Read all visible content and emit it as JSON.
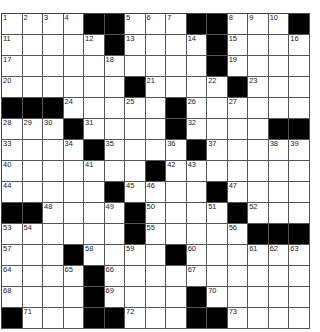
{
  "puzzle": {
    "rows": 15,
    "cols": 15,
    "colors": {
      "block": "#000000",
      "cell": "#ffffff",
      "line": "#555555",
      "number": "#222222"
    },
    "grid": [
      [
        1,
        2,
        3,
        4,
        "#",
        "#",
        5,
        6,
        7,
        "#",
        "#",
        8,
        9,
        10,
        "#"
      ],
      [
        11,
        0,
        0,
        0,
        12,
        "#",
        13,
        0,
        0,
        14,
        "#",
        15,
        0,
        0,
        16
      ],
      [
        17,
        0,
        0,
        0,
        0,
        18,
        0,
        0,
        0,
        0,
        "#",
        19,
        0,
        0,
        0
      ],
      [
        20,
        0,
        0,
        0,
        0,
        0,
        "#",
        21,
        0,
        0,
        22,
        "#",
        23,
        0,
        0
      ],
      [
        "#",
        "#",
        "#",
        24,
        0,
        0,
        25,
        0,
        "#",
        26,
        0,
        27,
        0,
        0,
        0
      ],
      [
        28,
        29,
        30,
        "#",
        31,
        0,
        0,
        0,
        "#",
        32,
        0,
        0,
        0,
        "#",
        "#"
      ],
      [
        33,
        0,
        0,
        34,
        "#",
        35,
        0,
        0,
        36,
        "#",
        37,
        0,
        0,
        38,
        39
      ],
      [
        40,
        0,
        0,
        0,
        41,
        0,
        0,
        "#",
        42,
        43,
        0,
        0,
        0,
        0,
        0
      ],
      [
        44,
        0,
        0,
        0,
        0,
        "#",
        45,
        46,
        0,
        0,
        "#",
        47,
        0,
        0,
        0
      ],
      [
        "#",
        "#",
        48,
        0,
        0,
        49,
        "#",
        50,
        0,
        0,
        51,
        "#",
        52,
        0,
        0
      ],
      [
        53,
        54,
        0,
        0,
        0,
        0,
        "#",
        55,
        0,
        0,
        0,
        56,
        "#",
        "#",
        "#"
      ],
      [
        57,
        0,
        0,
        "#",
        58,
        0,
        59,
        0,
        "#",
        60,
        0,
        0,
        61,
        62,
        63
      ],
      [
        64,
        0,
        0,
        65,
        "#",
        66,
        0,
        0,
        0,
        67,
        0,
        0,
        0,
        0,
        0
      ],
      [
        68,
        0,
        0,
        0,
        "#",
        69,
        0,
        0,
        0,
        "#",
        70,
        0,
        0,
        0,
        0
      ],
      [
        "#",
        71,
        0,
        0,
        "#",
        "#",
        72,
        0,
        0,
        "#",
        "#",
        73,
        0,
        0,
        0
      ]
    ]
  }
}
